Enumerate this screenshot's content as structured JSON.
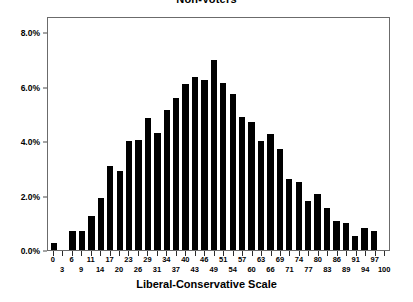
{
  "chart_data": {
    "type": "bar",
    "title": "Non-Voters",
    "xlabel": "Liberal-Conservative Scale",
    "ylabel": "",
    "ylim": [
      0,
      8.6
    ],
    "grid": false,
    "legend": null,
    "y_ticks": [
      {
        "value": 0.0,
        "label": "0.0%"
      },
      {
        "value": 2.0,
        "label": "2.0%"
      },
      {
        "value": 4.0,
        "label": "4.0%"
      },
      {
        "value": 6.0,
        "label": "6.0%"
      },
      {
        "value": 8.0,
        "label": "8.0%"
      }
    ],
    "categories": [
      "0",
      "3",
      "6",
      "9",
      "11",
      "14",
      "17",
      "20",
      "23",
      "26",
      "29",
      "31",
      "34",
      "37",
      "40",
      "43",
      "46",
      "49",
      "51",
      "54",
      "57",
      "60",
      "63",
      "66",
      "69",
      "71",
      "74",
      "77",
      "80",
      "83",
      "86",
      "89",
      "91",
      "94",
      "97",
      "100"
    ],
    "values": [
      0.25,
      0.0,
      0.7,
      0.7,
      1.25,
      1.9,
      3.1,
      2.9,
      4.0,
      4.05,
      4.85,
      4.3,
      5.15,
      5.6,
      6.1,
      6.35,
      6.25,
      7.0,
      6.15,
      5.75,
      4.9,
      4.7,
      4.0,
      4.25,
      3.7,
      2.6,
      2.5,
      1.8,
      2.05,
      1.55,
      1.05,
      1.0,
      0.5,
      0.8,
      0.7,
      0.0
    ],
    "bar_color": "#000000",
    "frame_color": "#6b6b6b",
    "background": "#ffffff"
  }
}
